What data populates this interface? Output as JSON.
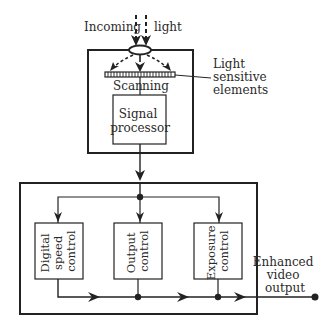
{
  "diagram": {
    "type": "block-diagram",
    "input": {
      "label_left": "Incoming",
      "label_right": "light"
    },
    "sensor_stage": {
      "scanning_label_a": "Scan",
      "scanning_label_b": "ning",
      "sensor_callout": {
        "line1": "Light",
        "line2": "sensitive",
        "line3": "elements"
      },
      "processor": {
        "line1": "Signal",
        "line2": "processor"
      }
    },
    "control_stage": {
      "blocks": [
        {
          "line1": "Digital",
          "line2": "speed",
          "line3": "control"
        },
        {
          "line1": "Output",
          "line2": "control"
        },
        {
          "line1": "Exposure",
          "line2": "control"
        }
      ]
    },
    "output": {
      "line1": "Enhanced",
      "line2": "video",
      "line3": "output"
    },
    "colors": {
      "stroke": "#222222",
      "background": "#ffffff"
    }
  }
}
